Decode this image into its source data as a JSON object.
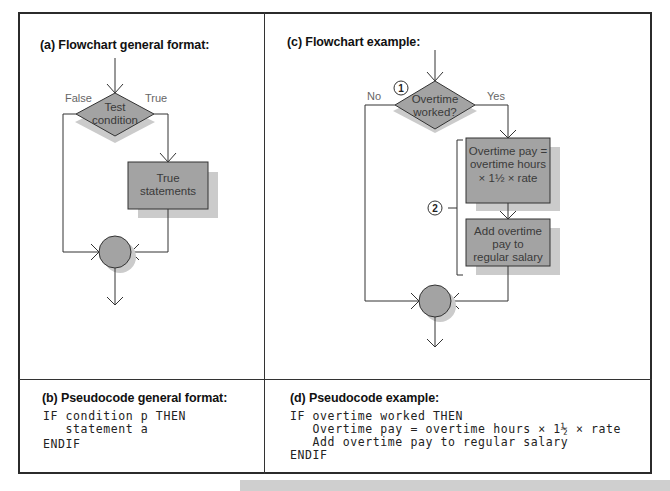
{
  "panels": {
    "a": {
      "title": "(a) Flowchart general format:",
      "decision_line1": "Test",
      "decision_line2": "condition",
      "false_label": "False",
      "true_label": "True",
      "process_line1": "True",
      "process_line2": "statements"
    },
    "b": {
      "title": "(b) Pseudocode general format:",
      "lines": [
        "IF condition p THEN",
        "   statement a",
        "ENDIF"
      ]
    },
    "c": {
      "title": "(c) Flowchart example:",
      "marker1": "1",
      "marker2": "2",
      "decision_line1": "Overtime",
      "decision_line2": "worked?",
      "no_label": "No",
      "yes_label": "Yes",
      "process1_line1": "Overtime pay =",
      "process1_line2": "overtime hours",
      "process1_line3": "× 1½ × rate",
      "process2_line1": "Add overtime",
      "process2_line2": "pay to",
      "process2_line3": "regular salary"
    },
    "d": {
      "title": "(d) Pseudocode example:",
      "lines": [
        "IF overtime worked THEN",
        "   Overtime pay = overtime hours × 1½ × rate",
        "   Add overtime pay to regular salary",
        "ENDIF"
      ]
    }
  },
  "colors": {
    "shape_fill": "#a3a3a3",
    "shadow_fill": "#cbcbcb",
    "stroke": "#333333",
    "label": "#666666"
  }
}
